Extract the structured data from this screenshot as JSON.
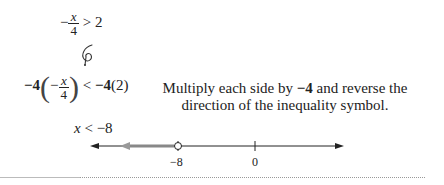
{
  "steps": {
    "original": {
      "sign": "−",
      "numerator": "x",
      "denominator": "4",
      "relation": ">",
      "rhs": "2"
    },
    "multiplied": {
      "lhs_factor": "−4",
      "inner_sign": "−",
      "numerator": "x",
      "denominator": "4",
      "relation": "<",
      "rhs_factor": "−4",
      "rhs_paren": "(2)"
    },
    "result": {
      "variable": "x",
      "relation": "<",
      "value": "−8"
    }
  },
  "annotation": {
    "line1_prefix": "Multiply each side by ",
    "line1_bold": "−4",
    "line1_suffix": " and reverse the",
    "line2": "direction of the inequality symbol."
  },
  "number_line": {
    "labels": [
      "−8",
      "0"
    ],
    "open_point": "−8",
    "shaded_direction": "left",
    "colors": {
      "line": "#222222",
      "shade": "#888888"
    }
  }
}
